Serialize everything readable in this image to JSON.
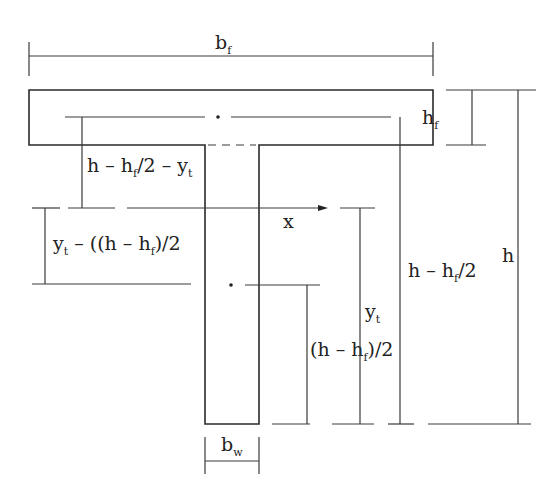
{
  "diagram": {
    "labels": {
      "flange_width": {
        "main": "b",
        "sub": "f"
      },
      "flange_height": {
        "main": "h",
        "sub": "f"
      },
      "total_height": {
        "main": "h"
      },
      "web_width": {
        "main": "b",
        "sub": "w"
      },
      "axis": "x",
      "dist_flange_centroid": {
        "p1": "h – h",
        "sub1": "f",
        "p2": "/2 – y",
        "sub2": "t"
      },
      "dist_web_offset": {
        "p1": "y",
        "sub1": "t",
        "p2": " – ((h – h",
        "sub2": "f",
        "p3": ")/2"
      },
      "half_depth_minus_flange": {
        "p1": "h – h",
        "sub1": "f",
        "p2": "/2"
      },
      "centroid_depth": {
        "main": "y",
        "sub": "t"
      },
      "web_centroid_depth": {
        "p1": "(h – h",
        "sub1": "f",
        "p2": ")/2"
      }
    },
    "colors": {
      "line": "#3a3a3a",
      "text": "#222222",
      "background": "#ffffff"
    }
  }
}
